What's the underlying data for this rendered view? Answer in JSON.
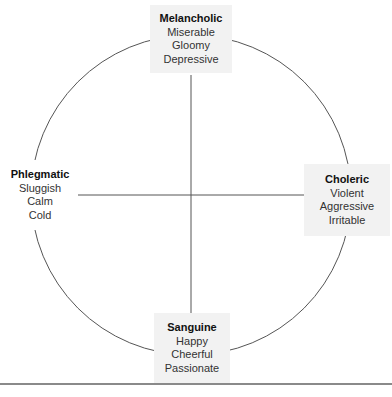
{
  "diagram": {
    "type": "four-temperaments-circle",
    "center": {
      "x": 191,
      "y": 195
    },
    "radius": 160,
    "colors": {
      "line": "#666666",
      "box_bg": "#f2f2f2",
      "text": "#333333"
    },
    "temperaments": {
      "top": {
        "title": "Melancholic",
        "traits": [
          "Miserable",
          "Gloomy",
          "Depressive"
        ]
      },
      "left": {
        "title": "Phlegmatic",
        "traits": [
          "Sluggish",
          "Calm",
          "Cold"
        ]
      },
      "right": {
        "title": "Choleric",
        "traits": [
          "Violent",
          "Aggressive",
          "Irritable"
        ]
      },
      "bottom": {
        "title": "Sanguine",
        "traits": [
          "Happy",
          "Cheerful",
          "Passionate"
        ]
      }
    }
  }
}
